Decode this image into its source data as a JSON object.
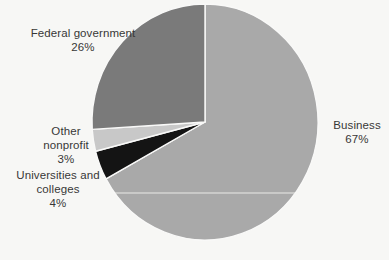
{
  "chart_data": {
    "type": "pie",
    "title": "",
    "direction": "clockwise",
    "start_angle_deg": 0,
    "total": 100,
    "legend_position": "labels-outside",
    "slices": [
      {
        "label": "Business",
        "value": 67,
        "display": "67%",
        "color": "#a9a9a9"
      },
      {
        "label": "Universities and colleges",
        "value": 4,
        "display": "4%",
        "color": "#141414"
      },
      {
        "label": "Other nonprofit",
        "value": 3,
        "display": "3%",
        "color": "#c8c8c8"
      },
      {
        "label": "Federal government",
        "value": 26,
        "display": "26%",
        "color": "#7a7a7a"
      }
    ],
    "callouts": {
      "federal": {
        "lines": [
          "Federal government",
          "26%"
        ]
      },
      "other": {
        "lines": [
          "Other",
          "nonprofit",
          "3%"
        ]
      },
      "universities": {
        "lines": [
          "Universities and",
          "colleges",
          "4%"
        ]
      },
      "business": {
        "lines": [
          "Business",
          "67%"
        ]
      }
    }
  },
  "colors": {
    "background": "#f7f7f5",
    "slice_divider": "#f9f9f8",
    "highlight_line": "#f2f2ef",
    "text": "#373737"
  }
}
